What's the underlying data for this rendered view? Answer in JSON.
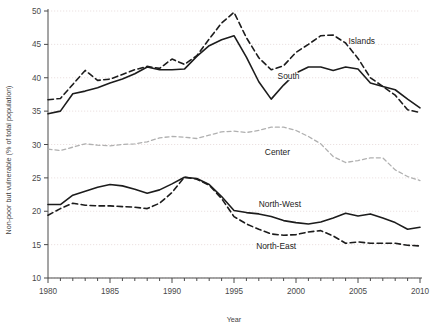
{
  "chart_data": {
    "type": "line",
    "title": "",
    "xlabel": "Year",
    "ylabel": "Non-poor but vulnerable (% of total population)",
    "xlim": [
      1980,
      2010
    ],
    "ylim": [
      10,
      50
    ],
    "xticks": [
      1980,
      1985,
      1990,
      1995,
      2000,
      2005,
      2010
    ],
    "xtick_labels": [
      "1980",
      "1985",
      "1990",
      "1995",
      "2000",
      "2005",
      "2010"
    ],
    "yticks": [
      10,
      15,
      20,
      25,
      30,
      35,
      40,
      45,
      50
    ],
    "ytick_labels": [
      "10",
      "15",
      "20",
      "25",
      "30",
      "35",
      "40",
      "45",
      "50"
    ],
    "grid": true,
    "grid_axis": "y",
    "legend_position": "inline-annotations",
    "x": [
      1980,
      1981,
      1982,
      1983,
      1984,
      1985,
      1986,
      1987,
      1988,
      1989,
      1990,
      1991,
      1992,
      1993,
      1994,
      1995,
      1996,
      1997,
      1998,
      1999,
      2000,
      2001,
      2002,
      2003,
      2004,
      2005,
      2006,
      2007,
      2008,
      2009,
      2010
    ],
    "series": [
      {
        "name": "Islands",
        "style": "dashed",
        "color": "#1c1c1c",
        "label_x": 2005.3,
        "label_y": 45.1,
        "values": [
          36.7,
          36.9,
          39.0,
          41.1,
          39.6,
          39.8,
          40.5,
          41.2,
          41.7,
          41.4,
          42.8,
          42.0,
          43.3,
          45.8,
          48.2,
          49.8,
          46.0,
          43.0,
          41.2,
          41.8,
          43.8,
          45.0,
          46.3,
          46.4,
          45.2,
          42.9,
          40.0,
          38.7,
          37.4,
          35.2,
          34.8
        ]
      },
      {
        "name": "South",
        "style": "solid",
        "color": "#1c1c1c",
        "label_x": 1999.4,
        "label_y": 39.8,
        "values": [
          34.6,
          35.0,
          37.6,
          38.0,
          38.5,
          39.2,
          39.8,
          40.6,
          41.6,
          41.2,
          41.2,
          41.3,
          43.2,
          44.8,
          45.7,
          46.3,
          43.1,
          39.4,
          36.8,
          38.9,
          40.7,
          41.6,
          41.6,
          41.1,
          41.6,
          41.3,
          39.2,
          38.7,
          38.2,
          36.8,
          35.5
        ]
      },
      {
        "name": "Center",
        "style": "dashed",
        "color": "#b0b0b0",
        "label_x": 1998.5,
        "label_y": 28.4,
        "values": [
          29.3,
          29.1,
          29.6,
          30.1,
          29.9,
          29.8,
          30.0,
          30.1,
          30.4,
          31.0,
          31.2,
          31.1,
          30.9,
          31.4,
          31.9,
          32.0,
          31.8,
          32.1,
          32.6,
          32.6,
          32.1,
          31.2,
          30.1,
          28.2,
          27.3,
          27.6,
          28.0,
          28.0,
          26.2,
          25.2,
          24.6
        ]
      },
      {
        "name": "North-West",
        "style": "solid",
        "color": "#1c1c1c",
        "label_x": 1998.7,
        "label_y": 20.6,
        "values": [
          21.0,
          21.0,
          22.4,
          23.0,
          23.6,
          24.0,
          23.8,
          23.3,
          22.7,
          23.2,
          24.1,
          25.1,
          24.9,
          24.0,
          22.2,
          20.1,
          19.8,
          19.6,
          19.2,
          18.6,
          18.3,
          18.1,
          18.4,
          19.0,
          19.7,
          19.3,
          19.6,
          19.0,
          18.3,
          17.3,
          17.6
        ]
      },
      {
        "name": "North-East",
        "style": "dashed",
        "color": "#1c1c1c",
        "label_x": 1998.4,
        "label_y": 14.4,
        "values": [
          19.4,
          20.4,
          21.2,
          20.9,
          20.8,
          20.8,
          20.7,
          20.6,
          20.4,
          21.2,
          22.8,
          25.1,
          24.8,
          23.9,
          21.9,
          19.2,
          18.1,
          17.3,
          16.6,
          16.4,
          16.5,
          16.9,
          17.1,
          16.3,
          15.2,
          15.4,
          15.2,
          15.2,
          15.2,
          14.9,
          14.8
        ]
      }
    ]
  },
  "axes": {
    "ylabel": "Non-poor but vulnerable (% of total population)",
    "xlabel": "Year"
  },
  "style": {
    "background": "#ffffff",
    "frame_color": "#4a4a4a",
    "grid_color": "#e6d9d9",
    "dark_series": "#1c1c1c",
    "light_series": "#b0b0b0"
  }
}
